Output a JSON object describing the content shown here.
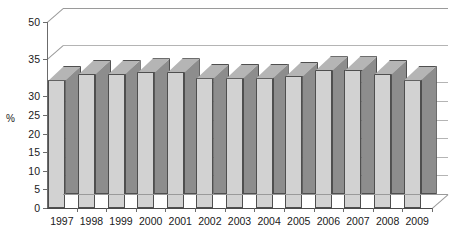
{
  "chart_data": {
    "type": "bar",
    "title": "",
    "subtitle": "",
    "xlabel": "",
    "ylabel": "%",
    "categories": [
      "1997",
      "1998",
      "1999",
      "2000",
      "2001",
      "2002",
      "2003",
      "2004",
      "2005",
      "2006",
      "2007",
      "2008",
      "2009"
    ],
    "values": [
      34.5,
      36,
      36,
      36.5,
      36.5,
      35,
      35,
      35,
      35.5,
      37,
      37,
      36,
      34.5
    ],
    "ytick_labels": [
      "50",
      "35",
      "30",
      "25",
      "20",
      "15",
      "10",
      "5",
      "0"
    ],
    "ytick_values": [
      50,
      40,
      30,
      25,
      20,
      15,
      10,
      5,
      0
    ],
    "ylim": [
      0,
      50
    ],
    "grid": true,
    "legend": null,
    "legend_position": "none",
    "style": "3d-column",
    "colors": {
      "bar_front": "#d2d2d2",
      "bar_side": "#8d8d8d",
      "bar_top": "#b5b5b5",
      "bar_outline": "#4f4f4f",
      "gridline": "#b4b4b4",
      "axis": "#6b6b6b",
      "background": "#ffffff",
      "text": "#1a1a1a"
    }
  }
}
